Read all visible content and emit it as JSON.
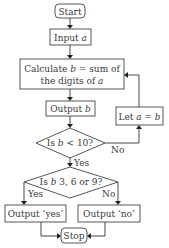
{
  "flowchart": {
    "start": "Start",
    "input": {
      "prefix": "Input ",
      "var": "a"
    },
    "calculate": {
      "line1_prefix": "Calculate ",
      "line1_var": "b",
      "line1_suffix": " = sum of",
      "line2_prefix": "the digits of ",
      "line2_var": "a"
    },
    "output_b": {
      "prefix": "Output ",
      "var": "b"
    },
    "decision1": {
      "prefix": "Is ",
      "var": "b",
      "suffix": " < 10?"
    },
    "decision1_no": "No",
    "decision1_yes": "Yes",
    "let": {
      "prefix": "Let ",
      "var1": "a",
      "mid": " = ",
      "var2": "b"
    },
    "decision2": {
      "prefix": "Is ",
      "var": "b",
      "suffix": " 3, 6 or 9?"
    },
    "decision2_yes": "Yes",
    "decision2_no": "No",
    "output_yes": "Output ‘yes’",
    "output_no": "Output ‘no’",
    "stop": "Stop"
  }
}
